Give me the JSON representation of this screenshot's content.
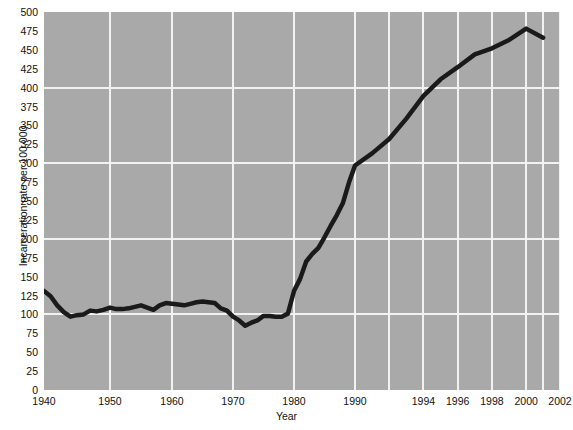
{
  "chart_data": {
    "type": "line",
    "title": "",
    "xlabel": "Year",
    "ylabel": "Incarceration rate per 100,000",
    "ylim": [
      0,
      500
    ],
    "ytick_values": [
      0,
      25,
      50,
      75,
      100,
      125,
      150,
      175,
      200,
      225,
      250,
      275,
      300,
      325,
      350,
      375,
      400,
      425,
      450,
      475,
      500
    ],
    "ytick_labels": [
      "0",
      "25",
      "50",
      "75",
      "100",
      "125",
      "150",
      "175",
      "200",
      "225",
      "250",
      "275",
      "300",
      "325",
      "350",
      "375",
      "400",
      "425",
      "450",
      "475",
      "500"
    ],
    "xtick_values": [
      1940,
      1950,
      1960,
      1970,
      1980,
      1990,
      1994,
      1996,
      1998,
      2000,
      2002
    ],
    "xtick_labels": [
      "1940",
      "1950",
      "1960",
      "1970",
      "1980",
      "1990",
      "1994",
      "1996",
      "1998",
      "2000",
      "2002"
    ],
    "x_axis_scale_note": "piecewise: 1940-1990 decades evenly spaced, 1990-2002 in 2-year steps evenly spaced",
    "grid": true,
    "grid_major_y": [
      100,
      200,
      300,
      400
    ],
    "legend": "none",
    "series": [
      {
        "name": "Incarceration rate",
        "color": "#1a1a1a",
        "line_width": 4,
        "x": [
          1940,
          1941,
          1942,
          1943,
          1944,
          1945,
          1946,
          1947,
          1948,
          1949,
          1950,
          1951,
          1952,
          1953,
          1954,
          1955,
          1956,
          1957,
          1958,
          1959,
          1960,
          1961,
          1962,
          1963,
          1964,
          1965,
          1966,
          1967,
          1968,
          1969,
          1970,
          1971,
          1972,
          1973,
          1974,
          1975,
          1976,
          1977,
          1978,
          1979,
          1980,
          1981,
          1982,
          1983,
          1984,
          1985,
          1986,
          1987,
          1988,
          1989,
          1990,
          1991,
          1992,
          1993,
          1994,
          1995,
          1996,
          1997,
          1998,
          1999,
          2000,
          2001
        ],
        "y": [
          131,
          124,
          112,
          103,
          97,
          99,
          100,
          105,
          104,
          106,
          109,
          107,
          107,
          108,
          110,
          112,
          109,
          106,
          112,
          115,
          114,
          113,
          112,
          114,
          116,
          117,
          116,
          115,
          108,
          105,
          97,
          92,
          85,
          89,
          92,
          98,
          98,
          97,
          97,
          101,
          131,
          147,
          170,
          180,
          188,
          202,
          217,
          231,
          247,
          274,
          297,
          313,
          332,
          359,
          389,
          411,
          427,
          444,
          452,
          463,
          478,
          466
        ]
      }
    ]
  },
  "axes": {
    "x_title": "Year",
    "y_title": "Incarceration rate per 100,000"
  },
  "colors": {
    "plot_background": "#a9a9a9",
    "gridline": "#f2f2f2",
    "line": "#1a1a1a",
    "text": "#111111",
    "page_background": "#ffffff"
  }
}
